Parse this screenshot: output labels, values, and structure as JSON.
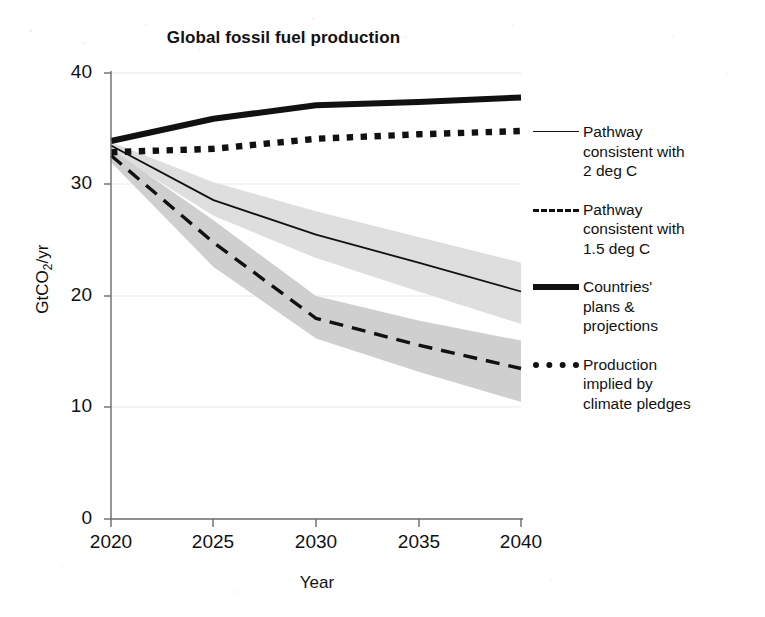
{
  "chart_data": {
    "type": "line",
    "title": "Global fossil fuel production",
    "xlabel": "Year",
    "ylabel": "GtCO2/yr",
    "ylabel_rich": "GtCO₂/yr",
    "x": [
      2020,
      2025,
      2030,
      2035,
      2040
    ],
    "xlim": [
      2019,
      2041
    ],
    "ylim": [
      0,
      40
    ],
    "xticks": [
      "2020",
      "2025",
      "2030",
      "2035",
      "2040"
    ],
    "yticks": [
      "0",
      "10",
      "20",
      "30",
      "40"
    ],
    "grid": "faint horizontal gridlines at 10, 20, 30, 40",
    "legend_position": "right, outside plot area",
    "series": [
      {
        "name": "Pathway consistent with 2 deg C",
        "style": "solid-thin",
        "color": "#111111",
        "x": [
          2020,
          2025,
          2030,
          2035,
          2040
        ],
        "values": [
          33.5,
          28.6,
          25.5,
          23.0,
          20.4
        ],
        "band": {
          "label": "2 deg C range",
          "color": "#dedede",
          "upper": [
            33.8,
            30.2,
            27.6,
            25.3,
            23.0
          ],
          "lower": [
            33.0,
            27.2,
            23.4,
            20.4,
            17.5
          ]
        }
      },
      {
        "name": "Pathway consistent with 1.5 deg C",
        "style": "dashed",
        "color": "#111111",
        "x": [
          2020,
          2025,
          2030,
          2035,
          2040
        ],
        "values": [
          32.6,
          24.8,
          18.0,
          15.6,
          13.5
        ],
        "band": {
          "label": "1.5 deg C range",
          "color": "#cfcfcf",
          "upper": [
            33.2,
            26.8,
            20.0,
            17.8,
            16.0
          ],
          "lower": [
            32.0,
            22.6,
            16.2,
            13.2,
            10.5
          ]
        }
      },
      {
        "name": "Countries' plans & projections",
        "style": "solid-bold",
        "color": "#111111",
        "x": [
          2020,
          2025,
          2030,
          2035,
          2040
        ],
        "values": [
          33.9,
          35.9,
          37.1,
          37.4,
          37.8
        ]
      },
      {
        "name": "Production implied by climate pledges",
        "style": "dotted",
        "color": "#111111",
        "x": [
          2020,
          2025,
          2030,
          2035,
          2040
        ],
        "values": [
          32.9,
          33.2,
          34.1,
          34.5,
          34.8
        ]
      }
    ]
  },
  "title": "Global fossil fuel production",
  "axes": {
    "y_title_pre": "GtCO",
    "y_title_sub": "2",
    "y_title_post": "/yr",
    "x_title": "Year",
    "y_ticks": [
      "40",
      "30",
      "20",
      "10",
      "0"
    ],
    "x_ticks": [
      "2020",
      "2025",
      "2030",
      "2035",
      "2040"
    ]
  },
  "legend": {
    "entries": [
      {
        "icon": "solid-thin-line-icon",
        "label": "Pathway\nconsistent with\n2 deg C"
      },
      {
        "icon": "dashed-line-icon",
        "label": "Pathway\nconsistent with\n1.5 deg C"
      },
      {
        "icon": "bold-solid-line-icon",
        "label": "Countries'\nplans &\nprojections"
      },
      {
        "icon": "dotted-line-icon",
        "label": "Production\nimplied by\nclimate pledges"
      }
    ]
  }
}
